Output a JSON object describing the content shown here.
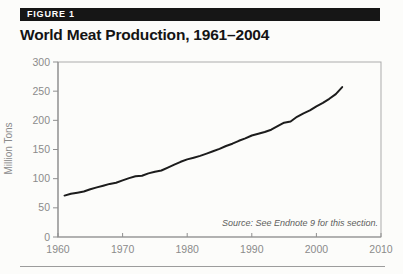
{
  "figure": {
    "label": "FIGURE 1"
  },
  "title": "World Meat Production, 1961–2004",
  "source_note": "Source: See Endnote 9 for this section.",
  "colors": {
    "bar_background": "#161616",
    "bar_text": "#ffffff",
    "line": "#1c1c1c",
    "axis": "#8f8f8f",
    "plot_border": "#ababab",
    "tick_text": "#8b8b8b"
  },
  "chart_data": {
    "type": "line",
    "title": "World Meat Production, 1961–2004",
    "xlabel": "",
    "ylabel": "Million Tons",
    "xlim": [
      1960,
      2010
    ],
    "ylim": [
      0,
      300
    ],
    "xticks": [
      1960,
      1970,
      1980,
      1990,
      2000,
      2010
    ],
    "yticks": [
      0,
      50,
      100,
      150,
      200,
      250,
      300
    ],
    "grid": false,
    "legend_position": "none",
    "series": [
      {
        "name": "World meat production (million tons)",
        "color": "#1c1c1c",
        "x": [
          1961,
          1962,
          1963,
          1964,
          1965,
          1966,
          1967,
          1968,
          1969,
          1970,
          1971,
          1972,
          1973,
          1974,
          1975,
          1976,
          1977,
          1978,
          1979,
          1980,
          1981,
          1982,
          1983,
          1984,
          1985,
          1986,
          1987,
          1988,
          1989,
          1990,
          1991,
          1992,
          1993,
          1994,
          1995,
          1996,
          1997,
          1998,
          1999,
          2000,
          2001,
          2002,
          2003,
          2004
        ],
        "values": [
          71,
          74,
          76,
          78,
          82,
          85,
          88,
          91,
          93,
          97,
          101,
          104,
          105,
          109,
          112,
          114,
          119,
          124,
          129,
          133,
          136,
          139,
          143,
          147,
          151,
          156,
          160,
          165,
          169,
          174,
          177,
          180,
          184,
          190,
          196,
          198,
          206,
          212,
          217,
          224,
          230,
          237,
          245,
          257
        ]
      }
    ],
    "annotations": [
      "Source: See Endnote 9 for this section."
    ]
  }
}
